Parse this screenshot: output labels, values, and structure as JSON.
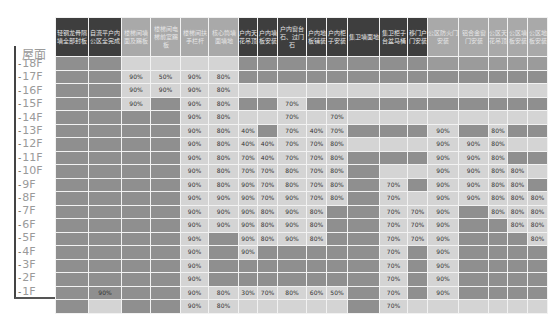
{
  "table": {
    "floor_header": "屋面",
    "columns": [
      {
        "label": "轻钢龙骨隔墙全部封板",
        "group": "dark"
      },
      {
        "label": "自流平户内公区全完成",
        "group": "dark"
      },
      {
        "label": "楼梯间墙面及踢板",
        "group": "mid"
      },
      {
        "label": "楼梯间电梯前室踢板",
        "group": "mid"
      },
      {
        "label": "楼梯间扶手栏杆",
        "group": "mid"
      },
      {
        "label": "核心筒墙面墙地",
        "group": "mid"
      },
      {
        "label": "户内天花吊顶",
        "group": "dark"
      },
      {
        "label": "户内墙板安装",
        "group": "dark"
      },
      {
        "label": "户内窗台石、过门石",
        "group": "dark"
      },
      {
        "label": "户内地板铺装",
        "group": "dark"
      },
      {
        "label": "户内柜子安装",
        "group": "dark"
      },
      {
        "label": "集卫墙面地",
        "group": "dark"
      },
      {
        "label": "集卫柜子台盆马桶",
        "group": "dark"
      },
      {
        "label": "移门户门安装",
        "group": "dark"
      },
      {
        "label": "公区防火门安装",
        "group": "mid"
      },
      {
        "label": "铝合金窗门安装",
        "group": "mid"
      },
      {
        "label": "公区天花吊顶",
        "group": "mid"
      },
      {
        "label": "公区墙板安装",
        "group": "mid"
      },
      {
        "label": "公区地板安装",
        "group": "mid"
      }
    ],
    "rows": [
      {
        "floor": "屋面",
        "cells": [
          "d",
          "d",
          "l",
          "l",
          "l",
          "l",
          "d",
          "d",
          "d",
          "d",
          "d",
          "d",
          "d",
          "d",
          "m",
          "m",
          "m",
          "m",
          "m"
        ],
        "values": [
          "",
          "",
          "",
          "",
          "",
          "",
          "",
          "",
          "",
          "",
          "",
          "",
          "",
          "",
          "",
          "",
          "",
          "",
          ""
        ]
      },
      {
        "floor": "18F",
        "cells": [
          "d",
          "d",
          "l",
          "l",
          "l",
          "l",
          "d",
          "d",
          "d",
          "d",
          "d",
          "d",
          "d",
          "d",
          "d",
          "d",
          "d",
          "d",
          "d"
        ],
        "values": [
          "",
          "",
          "90%",
          "50%",
          "90%",
          "80%",
          "",
          "",
          "",
          "",
          "",
          "",
          "",
          "",
          "",
          "",
          "",
          "",
          ""
        ]
      },
      {
        "floor": "17F",
        "cells": [
          "d",
          "d",
          "l",
          "l",
          "l",
          "l",
          "l",
          "l",
          "l",
          "l",
          "l",
          "l",
          "l",
          "l",
          "l",
          "l",
          "l",
          "l",
          "l"
        ],
        "values": [
          "",
          "",
          "90%",
          "90%",
          "90%",
          "80%",
          "",
          "",
          "",
          "",
          "",
          "",
          "",
          "",
          "",
          "",
          "",
          "",
          ""
        ]
      },
      {
        "floor": "16F",
        "cells": [
          "d",
          "d",
          "l",
          "d",
          "l",
          "l",
          "d",
          "d",
          "l",
          "d",
          "d",
          "d",
          "d",
          "d",
          "d",
          "d",
          "d",
          "d",
          "d"
        ],
        "values": [
          "",
          "",
          "90%",
          "",
          "90%",
          "80%",
          "",
          "",
          "70%",
          "",
          "",
          "",
          "",
          "",
          "",
          "",
          "",
          "",
          ""
        ]
      },
      {
        "floor": "15F",
        "cells": [
          "d",
          "d",
          "d",
          "d",
          "l",
          "l",
          "l",
          "l",
          "l",
          "l",
          "l",
          "l",
          "l",
          "l",
          "l",
          "l",
          "l",
          "l",
          "l"
        ],
        "values": [
          "",
          "",
          "",
          "",
          "90%",
          "80%",
          "",
          "",
          "70%",
          "",
          "70%",
          "",
          "",
          "",
          "",
          "",
          "",
          "",
          ""
        ]
      },
      {
        "floor": "14F",
        "cells": [
          "d",
          "d",
          "d",
          "d",
          "l",
          "l",
          "l",
          "d",
          "l",
          "l",
          "l",
          "d",
          "d",
          "d",
          "l",
          "d",
          "l",
          "d",
          "d"
        ],
        "values": [
          "",
          "",
          "",
          "",
          "90%",
          "80%",
          "40%",
          "",
          "70%",
          "40%",
          "70%",
          "",
          "",
          "",
          "90%",
          "",
          "80%",
          "",
          ""
        ]
      },
      {
        "floor": "13F",
        "cells": [
          "d",
          "d",
          "d",
          "d",
          "l",
          "l",
          "l",
          "l",
          "l",
          "l",
          "l",
          "l",
          "l",
          "l",
          "l",
          "l",
          "l",
          "l",
          "l"
        ],
        "values": [
          "",
          "",
          "",
          "",
          "90%",
          "80%",
          "40%",
          "40%",
          "70%",
          "70%",
          "80%",
          "",
          "",
          "",
          "90%",
          "90%",
          "80%",
          "",
          ""
        ]
      },
      {
        "floor": "12F",
        "cells": [
          "d",
          "d",
          "d",
          "d",
          "l",
          "l",
          "l",
          "l",
          "l",
          "l",
          "l",
          "d",
          "d",
          "d",
          "l",
          "l",
          "l",
          "d",
          "d"
        ],
        "values": [
          "",
          "",
          "",
          "",
          "90%",
          "80%",
          "70%",
          "40%",
          "70%",
          "70%",
          "80%",
          "",
          "",
          "",
          "90%",
          "90%",
          "80%",
          "",
          ""
        ]
      },
      {
        "floor": "11F",
        "cells": [
          "d",
          "d",
          "d",
          "d",
          "l",
          "l",
          "l",
          "l",
          "l",
          "l",
          "l",
          "d",
          "l",
          "l",
          "l",
          "l",
          "l",
          "l",
          "l"
        ],
        "values": [
          "",
          "",
          "",
          "",
          "90%",
          "80%",
          "70%",
          "70%",
          "80%",
          "70%",
          "80%",
          "",
          "",
          "",
          "90%",
          "90%",
          "80%",
          "80%",
          ""
        ]
      },
      {
        "floor": "10F",
        "cells": [
          "d",
          "d",
          "d",
          "d",
          "l",
          "l",
          "l",
          "l",
          "l",
          "l",
          "l",
          "d",
          "l",
          "d",
          "l",
          "l",
          "l",
          "l",
          "d"
        ],
        "values": [
          "",
          "",
          "",
          "",
          "90%",
          "80%",
          "90%",
          "70%",
          "80%",
          "70%",
          "80%",
          "",
          "70%",
          "",
          "90%",
          "90%",
          "80%",
          "80%",
          ""
        ]
      },
      {
        "floor": "9F",
        "cells": [
          "d",
          "d",
          "d",
          "d",
          "l",
          "l",
          "l",
          "l",
          "l",
          "l",
          "l",
          "d",
          "l",
          "l",
          "l",
          "l",
          "l",
          "l",
          "l"
        ],
        "values": [
          "",
          "",
          "",
          "",
          "90%",
          "90%",
          "90%",
          "70%",
          "90%",
          "70%",
          "80%",
          "",
          "70%",
          "",
          "90%",
          "90%",
          "80%",
          "80%",
          "80%"
        ]
      },
      {
        "floor": "8F",
        "cells": [
          "d",
          "d",
          "d",
          "d",
          "l",
          "l",
          "l",
          "l",
          "l",
          "l",
          "d",
          "d",
          "l",
          "l",
          "l",
          "d",
          "l",
          "l",
          "l"
        ],
        "values": [
          "",
          "",
          "",
          "",
          "90%",
          "90%",
          "90%",
          "80%",
          "90%",
          "80%",
          "",
          "",
          "70%",
          "70%",
          "90%",
          "",
          "80%",
          "80%",
          "80%"
        ]
      },
      {
        "floor": "7F",
        "cells": [
          "d",
          "d",
          "d",
          "d",
          "l",
          "l",
          "l",
          "l",
          "l",
          "l",
          "d",
          "d",
          "l",
          "l",
          "l",
          "d",
          "d",
          "l",
          "l"
        ],
        "values": [
          "",
          "",
          "",
          "",
          "90%",
          "90%",
          "90%",
          "80%",
          "90%",
          "80%",
          "",
          "",
          "70%",
          "70%",
          "90%",
          "",
          "",
          "80%",
          "80%"
        ]
      },
      {
        "floor": "6F",
        "cells": [
          "d",
          "d",
          "d",
          "d",
          "l",
          "d",
          "l",
          "l",
          "l",
          "l",
          "d",
          "d",
          "l",
          "l",
          "l",
          "d",
          "d",
          "d",
          "l"
        ],
        "values": [
          "",
          "",
          "",
          "",
          "90%",
          "",
          "90%",
          "80%",
          "90%",
          "80%",
          "",
          "",
          "70%",
          "70%",
          "90%",
          "",
          "",
          "",
          "80%"
        ]
      },
      {
        "floor": "5F",
        "cells": [
          "d",
          "d",
          "d",
          "d",
          "l",
          "d",
          "l",
          "d",
          "d",
          "d",
          "d",
          "d",
          "l",
          "d",
          "l",
          "d",
          "d",
          "d",
          "d"
        ],
        "values": [
          "",
          "",
          "",
          "",
          "90%",
          "",
          "90%",
          "",
          "",
          "",
          "",
          "",
          "70%",
          "",
          "90%",
          "",
          "",
          "",
          ""
        ]
      },
      {
        "floor": "4F",
        "cells": [
          "d",
          "d",
          "d",
          "d",
          "l",
          "d",
          "d",
          "d",
          "d",
          "d",
          "d",
          "d",
          "l",
          "d",
          "l",
          "d",
          "d",
          "d",
          "d"
        ],
        "values": [
          "",
          "",
          "",
          "",
          "90%",
          "",
          "",
          "",
          "",
          "",
          "",
          "",
          "70%",
          "",
          "90%",
          "",
          "",
          "",
          ""
        ]
      },
      {
        "floor": "3F",
        "cells": [
          "d",
          "d",
          "d",
          "d",
          "l",
          "d",
          "d",
          "d",
          "d",
          "d",
          "d",
          "d",
          "l",
          "d",
          "l",
          "d",
          "d",
          "d",
          "d"
        ],
        "values": [
          "",
          "",
          "",
          "",
          "90%",
          "",
          "",
          "",
          "",
          "",
          "",
          "",
          "70%",
          "",
          "90%",
          "",
          "",
          "",
          ""
        ]
      },
      {
        "floor": "2F",
        "cells": [
          "d",
          "d",
          "d",
          "d",
          "l",
          "l",
          "l",
          "l",
          "l",
          "l",
          "l",
          "d",
          "l",
          "d",
          "l",
          "d",
          "d",
          "d",
          "d"
        ],
        "values": [
          "",
          "90%",
          "",
          "",
          "90%",
          "80%",
          "30%",
          "70%",
          "80%",
          "60%",
          "50%",
          "",
          "70%",
          "",
          "90%",
          "",
          "",
          "",
          ""
        ]
      },
      {
        "floor": "1F",
        "cells": [
          "d",
          "l",
          "d",
          "d",
          "l",
          "l",
          "l",
          "l",
          "l",
          "l",
          "l",
          "d",
          "l",
          "l",
          "l",
          "l",
          "l",
          "l",
          "l"
        ],
        "values": [
          "",
          "",
          "",
          "",
          "90%",
          "80%",
          "",
          "",
          "",
          "",
          "",
          "",
          "70%",
          "",
          "",
          "",
          "",
          "",
          ""
        ]
      }
    ]
  },
  "floor_labels": [
    "18F",
    "17F",
    "16F",
    "15F",
    "14F",
    "13F",
    "12F",
    "11F",
    "10F",
    "9F",
    "8F",
    "7F",
    "6F",
    "5F",
    "4F",
    "3F",
    "2F",
    "1F"
  ],
  "colors": {
    "dark_header": "#3e3e3e",
    "mid_header": "#a9a9a9",
    "dark_cell": "#8f8f8f",
    "light_cell": "#d4d4d4",
    "mid_cell": "#9b9b9b"
  }
}
